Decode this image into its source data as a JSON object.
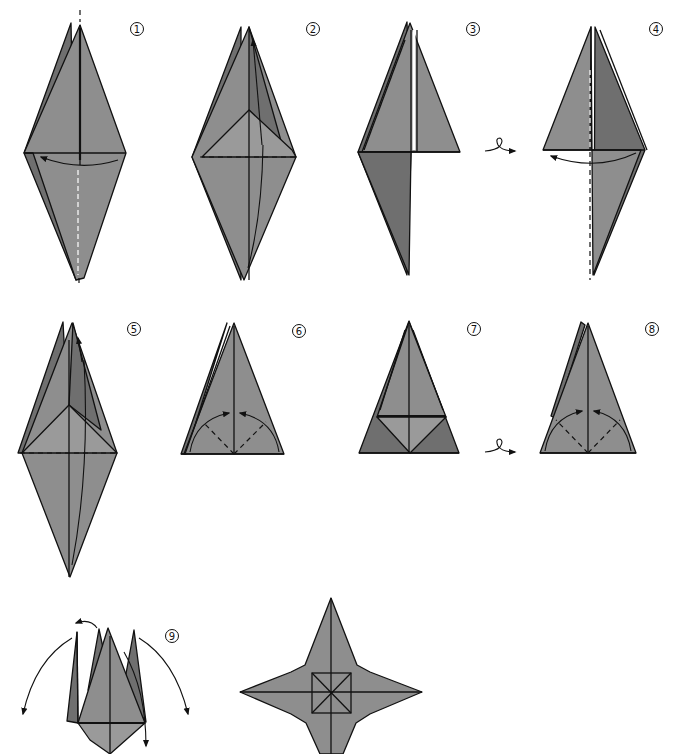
{
  "diagram": {
    "colors": {
      "paper": "#8e8e8e",
      "paper_dark": "#6f6f6f",
      "paper_light": "#9a9a9a",
      "line": "#111111",
      "background": "#ffffff"
    },
    "steps": [
      {
        "number": "1",
        "label_pos": [
          137,
          29
        ],
        "instruction": "Fold one flap from right to left along the vertical axis"
      },
      {
        "number": "2",
        "label_pos": [
          313,
          29
        ],
        "instruction": "Fold the flap up along the dashed line"
      },
      {
        "number": "3",
        "label_pos": [
          473,
          29
        ],
        "instruction": "Turn the model over"
      },
      {
        "number": "4",
        "label_pos": [
          656,
          29
        ],
        "instruction": "Fold one flap from right to left"
      },
      {
        "number": "5",
        "label_pos": [
          134,
          329
        ],
        "instruction": "Repeat the fold on the remaining flaps"
      },
      {
        "number": "6",
        "label_pos": [
          299,
          331
        ],
        "instruction": "Valley fold both lower corners to the center"
      },
      {
        "number": "7",
        "label_pos": [
          474,
          329
        ],
        "instruction": "Turn the model over"
      },
      {
        "number": "8",
        "label_pos": [
          652,
          329
        ],
        "instruction": "Valley fold both lower corners to the center"
      },
      {
        "number": "9",
        "label_pos": [
          172,
          636
        ],
        "instruction": "Open out the four points"
      }
    ],
    "symbols": {
      "turn_over": [
        "after-step-3",
        "after-step-7"
      ],
      "result": "four-pointed star"
    }
  }
}
